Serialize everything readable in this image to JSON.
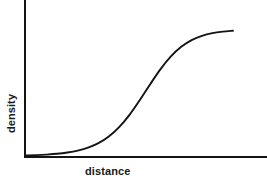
{
  "figure": {
    "background_color": "#ffffff",
    "line_color": "#141414",
    "axes": {
      "x_label": "distance",
      "y_label": "density"
    }
  },
  "chart_data": {
    "type": "line",
    "title": "",
    "subtitle": "",
    "xlabel": "distance",
    "ylabel": "density",
    "xlim": [
      0,
      1
    ],
    "ylim": [
      0,
      1
    ],
    "grid": false,
    "legend": false,
    "legend_position": "none",
    "axis_ticks": {
      "x_ticks": [],
      "y_ticks": [],
      "x_tick_labels": [],
      "y_tick_labels": []
    },
    "annotations": [],
    "series": [
      {
        "name": "density vs distance",
        "shape": "sigmoid",
        "color": "#141414",
        "x": [
          0.0,
          0.05,
          0.1,
          0.15,
          0.2,
          0.25,
          0.3,
          0.35,
          0.4,
          0.45,
          0.5,
          0.55,
          0.6,
          0.65,
          0.7,
          0.75,
          0.8,
          0.85,
          0.9,
          0.95,
          1.0
        ],
        "values": [
          0.005,
          0.007,
          0.011,
          0.017,
          0.027,
          0.042,
          0.065,
          0.1,
          0.152,
          0.225,
          0.321,
          0.437,
          0.561,
          0.679,
          0.778,
          0.853,
          0.905,
          0.939,
          0.96,
          0.972,
          0.979
        ]
      }
    ]
  }
}
